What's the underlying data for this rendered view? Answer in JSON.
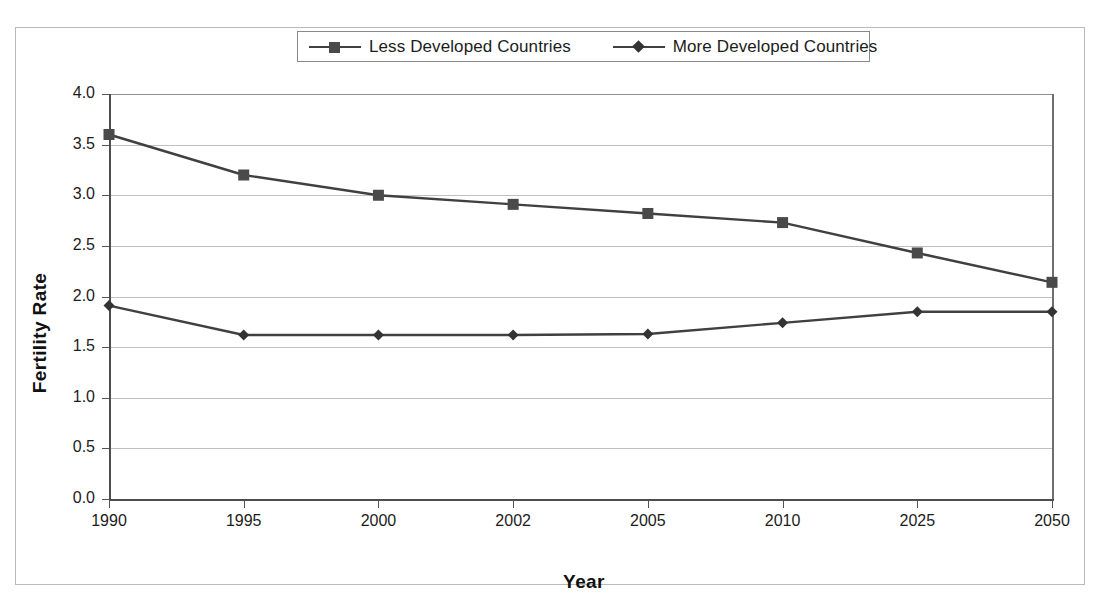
{
  "chart_data": {
    "type": "line",
    "title": "",
    "xlabel": "Year",
    "ylabel": "Fertility Rate",
    "categories": [
      "1990",
      "1995",
      "2000",
      "2002",
      "2005",
      "2010",
      "2025",
      "2050"
    ],
    "series": [
      {
        "name": "Less Developed Countries",
        "marker": "square",
        "color": "#4a4a4a",
        "values": [
          3.6,
          3.2,
          3.0,
          2.91,
          2.82,
          2.73,
          2.43,
          2.14
        ]
      },
      {
        "name": "More Developed Countries",
        "marker": "diamond",
        "color": "#333333",
        "values": [
          1.91,
          1.62,
          1.62,
          1.62,
          1.63,
          1.74,
          1.85,
          1.85
        ]
      }
    ],
    "ylim": [
      0.0,
      4.0
    ],
    "yticks": [
      "0.0",
      "0.5",
      "1.0",
      "1.5",
      "2.0",
      "2.5",
      "3.0",
      "3.5",
      "4.0"
    ],
    "ytick_values": [
      0.0,
      0.5,
      1.0,
      1.5,
      2.0,
      2.5,
      3.0,
      3.5,
      4.0
    ],
    "grid": true,
    "legend_position": "top"
  },
  "legend": {
    "entries": [
      {
        "label": "Less Developed Countries",
        "marker": "square-marker-icon"
      },
      {
        "label": "More Developed Countries",
        "marker": "diamond-marker-icon"
      }
    ]
  },
  "colors": {
    "series_line": "#404040",
    "gridline": "#c0c0c0",
    "axis": "#4d4d4d",
    "frame_border": "#b9b9b9",
    "legend_border": "#8a8a8a",
    "text": "#1c1c1c",
    "background": "#ffffff"
  }
}
